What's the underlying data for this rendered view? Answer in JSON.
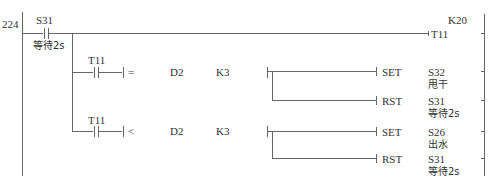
{
  "rung": {
    "number": "224",
    "main_contact": {
      "device": "S31",
      "comment": "等待2s"
    },
    "timer_output": {
      "device": "T11",
      "setting": "K20"
    }
  },
  "branches": [
    {
      "contact": "T11",
      "compare": {
        "operator": "=",
        "operand1": "D2",
        "operand2": "K3"
      },
      "outputs": [
        {
          "instruction": "SET",
          "device": "S32",
          "comment": "甩干"
        },
        {
          "instruction": "RST",
          "device": "S31",
          "comment": "等待2s"
        }
      ]
    },
    {
      "contact": "T11",
      "compare": {
        "operator": "<",
        "operand1": "D2",
        "operand2": "K3"
      },
      "outputs": [
        {
          "instruction": "SET",
          "device": "S26",
          "comment": "出水"
        },
        {
          "instruction": "RST",
          "device": "S31",
          "comment": "等待2s"
        }
      ]
    }
  ],
  "colors": {
    "line": "#555555",
    "text": "#333333",
    "background": "#ffffff"
  }
}
